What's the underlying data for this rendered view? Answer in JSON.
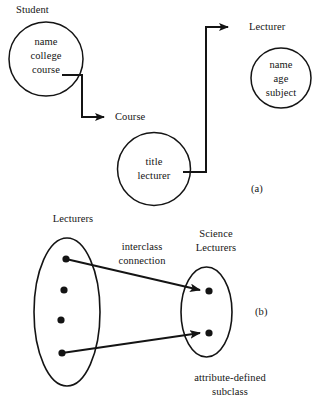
{
  "figure": {
    "ink_color": "#141414",
    "background_color": "#ffffff"
  },
  "part_a": {
    "tag": "(a)",
    "entities": [
      {
        "name": "student-entity",
        "label": "Student",
        "attributes": [
          "name",
          "college",
          "course"
        ],
        "shape": "circle"
      },
      {
        "name": "course-entity",
        "label": "Course",
        "attributes": [
          "title",
          "lecturer"
        ],
        "shape": "circle"
      },
      {
        "name": "lecturer-entity",
        "label": "Lecturer",
        "attributes": [
          "name",
          "age",
          "subject"
        ],
        "shape": "circle"
      }
    ],
    "connections": [
      {
        "name": "student-to-course",
        "from": "Student",
        "to": "Course",
        "style": "orthogonal-arrow"
      },
      {
        "name": "course-to-lecturer",
        "from": "Course",
        "to": "Lecturer",
        "style": "orthogonal-arrow"
      }
    ]
  },
  "part_b": {
    "tag": "(b)",
    "left_set": {
      "label": "Lecturers",
      "member_count": 4
    },
    "right_set": {
      "label_line1": "Science",
      "label_line2": "Lecturers",
      "member_count": 2
    },
    "connection_label_line1": "interclass",
    "connection_label_line2": "connection",
    "caption_line1": "attribute-defined",
    "caption_line2": "subclass",
    "mappings": [
      {
        "name": "mapping-top",
        "from_member": 1,
        "to_member": 1
      },
      {
        "name": "mapping-bottom",
        "from_member": 4,
        "to_member": 2
      }
    ]
  }
}
